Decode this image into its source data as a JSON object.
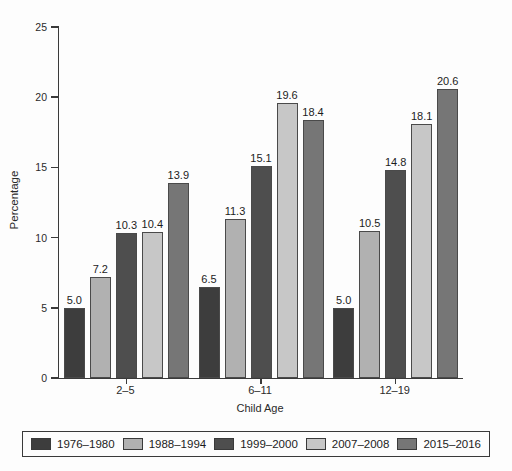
{
  "chart_data": {
    "type": "bar",
    "title": "",
    "xlabel": "Child Age",
    "ylabel": "Percentage",
    "ylim": [
      0,
      25
    ],
    "yticks": [
      0,
      5,
      10,
      15,
      20,
      25
    ],
    "categories": [
      "2–5",
      "6–11",
      "12–19"
    ],
    "series": [
      {
        "name": "1976–1980",
        "color": "#3d3d3d",
        "values": [
          5.0,
          6.5,
          5.0
        ]
      },
      {
        "name": "1988–1994",
        "color": "#b1b1b1",
        "values": [
          7.2,
          11.3,
          10.5
        ]
      },
      {
        "name": "1999–2000",
        "color": "#4e4e4e",
        "values": [
          10.3,
          15.1,
          14.8
        ]
      },
      {
        "name": "2007–2008",
        "color": "#c7c7c7",
        "values": [
          10.4,
          19.6,
          18.1
        ]
      },
      {
        "name": "2015–2016",
        "color": "#767676",
        "values": [
          13.9,
          18.4,
          20.6
        ]
      }
    ],
    "value_labels": [
      [
        "5.0",
        "7.2",
        "10.3",
        "10.4",
        "13.9"
      ],
      [
        "6.5",
        "11.3",
        "15.1",
        "19.6",
        "18.4"
      ],
      [
        "5.0",
        "10.5",
        "14.8",
        "18.1",
        "20.6"
      ]
    ],
    "legend_position": "bottom",
    "grid": "off",
    "colors": {
      "axis": "#3a3a3a",
      "text": "#1c1c1c",
      "background": "#fdfdfd"
    }
  }
}
